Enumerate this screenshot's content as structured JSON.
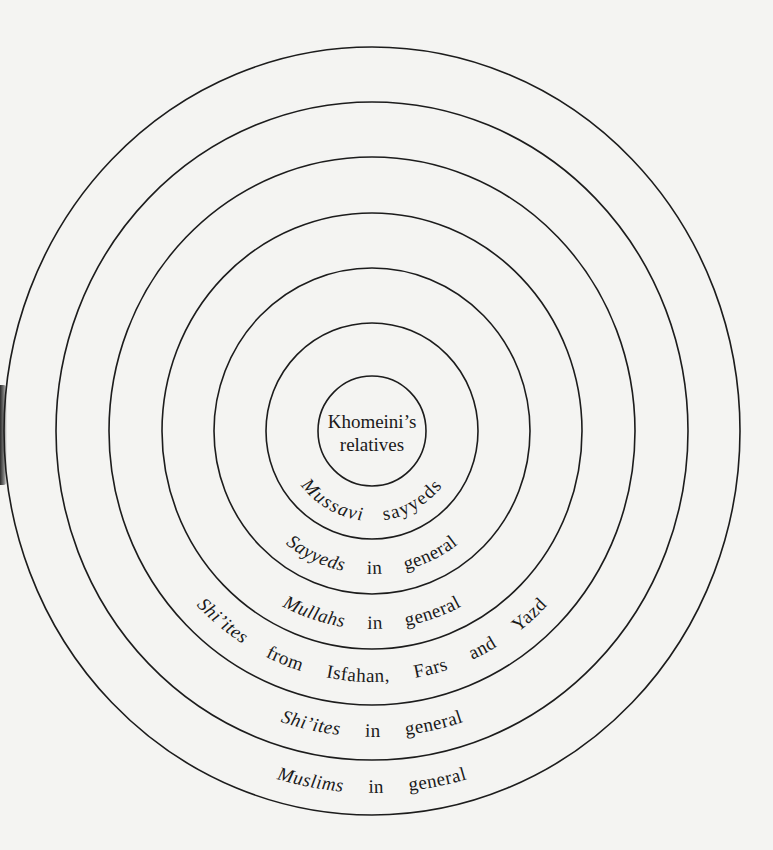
{
  "diagram": {
    "type": "concentric-circles",
    "center": {
      "x": 372,
      "y": 431
    },
    "ring_color": "#1c1c1c",
    "background_color": "#f4f4f2",
    "rings": [
      {
        "level": 1,
        "rx": 54,
        "ry": 55,
        "label_lines": [
          "Khomeini’s",
          "relatives"
        ]
      },
      {
        "level": 2,
        "rx": 106,
        "ry": 108,
        "label": "Mussavi   sayyeds",
        "first": "Mussavi",
        "rest": "sayyeds"
      },
      {
        "level": 3,
        "rx": 158,
        "ry": 163,
        "label": "Sayyeds   in   general",
        "first": "Sayyeds",
        "rest": "in   general"
      },
      {
        "level": 4,
        "rx": 210,
        "ry": 218,
        "label": "Mullahs   in   general",
        "first": "Mullahs",
        "rest": "in   general"
      },
      {
        "level": 5,
        "rx": 263,
        "ry": 274,
        "label": "Shi’ites   from   Isfahan,   Fars   and   Yazd",
        "first": "Shi’ites",
        "rest": "from   Isfahan,   Fars   and   Yazd"
      },
      {
        "level": 6,
        "rx": 316,
        "ry": 329,
        "label": "Shi’ites   in   general",
        "first": "Shi’ites",
        "rest": "in   general"
      },
      {
        "level": 7,
        "rx": 368,
        "ry": 384,
        "label": "Muslims   in   general",
        "first": "Muslims",
        "rest": "in   general"
      }
    ]
  },
  "labels": {
    "center_line1": "Khomeini’s",
    "center_line2": "relatives",
    "ring2_first": "Mussavi",
    "ring2_rest": " sayyeds",
    "ring3_first": "Sayyeds",
    "ring3_rest": " in general",
    "ring4_first": "Mullahs",
    "ring4_rest": " in general",
    "ring5_first": "Shi’ites",
    "ring5_rest": " from Isfahan, Fars and Yazd",
    "ring6_first": "Shi’ites",
    "ring6_rest": " in general",
    "ring7_first": "Muslims",
    "ring7_rest": " in general"
  }
}
